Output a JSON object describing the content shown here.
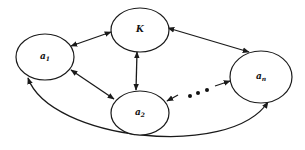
{
  "diagram": {
    "type": "network-graph",
    "colors": {
      "stroke": "#1a1a1a",
      "background": "#ffffff",
      "text": "#111111"
    },
    "nodes": [
      {
        "id": "a1",
        "label_main": "a",
        "label_sub": "1"
      },
      {
        "id": "K",
        "label_main": "K",
        "label_sub": ""
      },
      {
        "id": "a2",
        "label_main": "a",
        "label_sub": "2"
      },
      {
        "id": "an",
        "label_main": "a",
        "label_sub": "n"
      }
    ],
    "edges": [
      {
        "from": "a1",
        "to": "K",
        "direction": "bidirectional"
      },
      {
        "from": "K",
        "to": "an",
        "direction": "bidirectional"
      },
      {
        "from": "K",
        "to": "a2",
        "direction": "bidirectional"
      },
      {
        "from": "a1",
        "to": "a2",
        "direction": "bidirectional"
      },
      {
        "from": "a1",
        "to": "an",
        "direction": "bidirectional",
        "style": "curved-bottom"
      },
      {
        "from": "a2",
        "to": "an",
        "direction": "bidirectional",
        "style": "ellipsis",
        "label": "• • •"
      }
    ]
  }
}
